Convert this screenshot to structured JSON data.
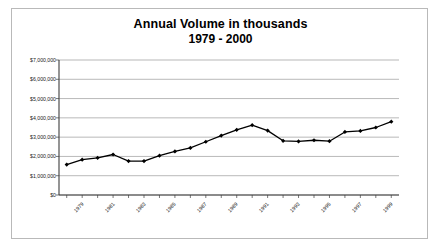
{
  "chart_data": {
    "type": "line",
    "title": "Annual Volume in thousands",
    "subtitle": "1979 - 2000",
    "xlabel": "",
    "ylabel": "",
    "grid": true,
    "legend": "none",
    "ylim": [
      0,
      7000000
    ],
    "ytick_step": 1000000,
    "ytick_labels": [
      "$7,000,000",
      "$6,000,000",
      "$5,000,000",
      "$4,000,000",
      "$3,000,000",
      "$2,000,000",
      "$1,000,000",
      "$0"
    ],
    "ytick_values": [
      7000000,
      6000000,
      5000000,
      4000000,
      3000000,
      2000000,
      1000000,
      0
    ],
    "xtick_labels": [
      "1979",
      "1981",
      "1983",
      "1985",
      "1987",
      "1989",
      "1991",
      "1993",
      "1995",
      "1997",
      "1999"
    ],
    "categories": [
      "1979",
      "1980",
      "1981",
      "1982",
      "1983",
      "1984",
      "1985",
      "1986",
      "1987",
      "1988",
      "1989",
      "1990",
      "1991",
      "1992",
      "1993",
      "1994",
      "1995",
      "1996",
      "1997",
      "1998",
      "1999",
      "2000"
    ],
    "values": [
      1580000,
      1830000,
      1930000,
      2100000,
      1760000,
      1760000,
      2040000,
      2260000,
      2440000,
      2760000,
      3080000,
      3380000,
      3620000,
      3340000,
      2810000,
      2780000,
      2840000,
      2790000,
      3270000,
      3320000,
      3500000,
      3800000
    ],
    "series": [
      {
        "name": "Annual Volume",
        "color": "#000000",
        "marker": "diamond",
        "values": [
          1580000,
          1830000,
          1930000,
          2100000,
          1760000,
          1760000,
          2040000,
          2260000,
          2440000,
          2760000,
          3080000,
          3380000,
          3620000,
          3340000,
          2810000,
          2780000,
          2840000,
          2790000,
          3270000,
          3320000,
          3500000,
          3800000
        ]
      }
    ]
  },
  "style": {
    "grid_color": "#9a9a9a",
    "axis_color": "#3d3d3d",
    "line_color": "#000000",
    "border_color": "#b9b9b9",
    "background": "#ffffff"
  }
}
